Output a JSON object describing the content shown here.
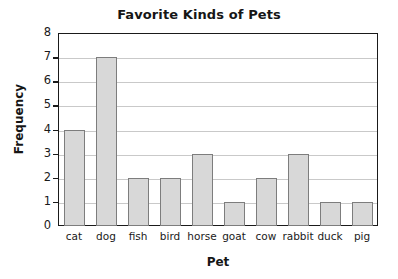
{
  "chart_data": {
    "type": "bar",
    "title": "Favorite Kinds of Pets",
    "xlabel": "Pet",
    "ylabel": "Frequency",
    "categories": [
      "cat",
      "dog",
      "fish",
      "bird",
      "horse",
      "goat",
      "cow",
      "rabbit",
      "duck",
      "pig"
    ],
    "values": [
      4,
      7,
      2,
      2,
      3,
      1,
      2,
      3,
      1,
      1
    ],
    "ylim": [
      0,
      8
    ],
    "yticks": [
      0,
      1,
      2,
      3,
      4,
      5,
      6,
      7,
      8
    ],
    "ytick_labels": [
      "0",
      "1",
      "2",
      "3",
      "4",
      "5",
      "6",
      "7",
      "8"
    ],
    "grid": true,
    "grid_axis": "y",
    "legend": false,
    "colors": {
      "bar_fill": "#d8d8d8",
      "bar_border": "#7d7d7d",
      "gridline": "#c9c9c9",
      "frame": "#1a1a1a",
      "text": "#161616",
      "background": "#ffffff"
    }
  }
}
